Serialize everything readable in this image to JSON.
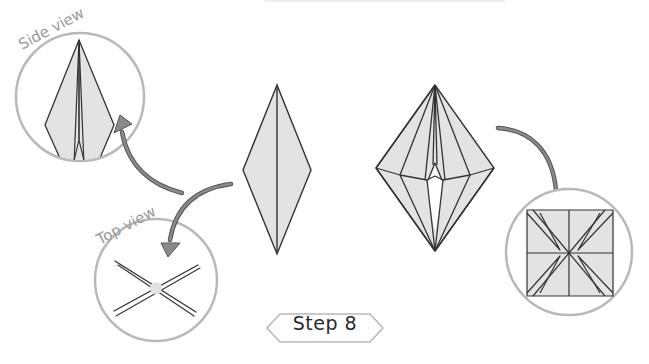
{
  "diagram": {
    "step_label": "Step 8",
    "side_view_label": "Side view",
    "top_view_label": "Top view",
    "colors": {
      "paper_fill": "#e3e3e3",
      "line": "#333333",
      "circle_stroke": "#b5b5b5",
      "arrow_fill": "#8a8a8a",
      "arrow_stroke": "#555555"
    },
    "elements": [
      "side-view-circle",
      "top-view-circle",
      "folded-diamond",
      "opened-model",
      "result-square-circle",
      "step-badge"
    ]
  }
}
